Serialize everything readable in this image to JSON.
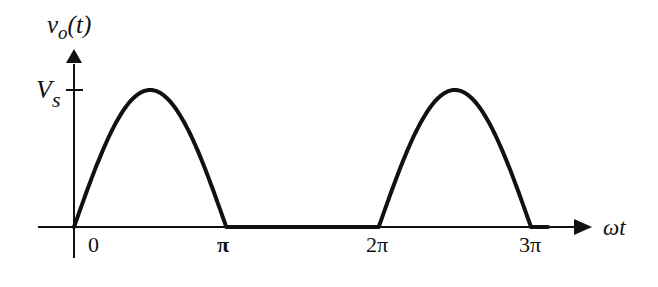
{
  "chart_data": {
    "type": "line",
    "title": "",
    "xlabel": "ωt",
    "ylabel": "v_o(t)",
    "ylabel_parts": {
      "main": "v",
      "sub": "o",
      "arg": "(t)"
    },
    "x_ticks": [
      {
        "value": 0,
        "label": "0"
      },
      {
        "value": 3.14159,
        "label": "π"
      },
      {
        "value": 6.28318,
        "label": "2π"
      },
      {
        "value": 9.42478,
        "label": "3π"
      }
    ],
    "y_ticks": [
      {
        "value": 1,
        "label": "V",
        "sub": "s"
      }
    ],
    "xlim": [
      0,
      9.42478
    ],
    "ylim": [
      0,
      1
    ],
    "grid": false,
    "legend": null,
    "series": [
      {
        "name": "v_o(t) half-wave rectified sine",
        "description": "Vs·sin(ωt) for 0≤ωt≤π and 2π≤ωt≤3π, zero otherwise",
        "x": [
          0,
          0.3927,
          0.7854,
          1.1781,
          1.5708,
          1.9635,
          2.3562,
          2.7489,
          3.14159,
          4.0,
          5.0,
          6.28318,
          6.6759,
          7.0686,
          7.4613,
          7.854,
          8.2467,
          8.6394,
          9.0321,
          9.42478
        ],
        "y": [
          0,
          0.383,
          0.707,
          0.924,
          1.0,
          0.924,
          0.707,
          0.383,
          0,
          0,
          0,
          0,
          0.383,
          0.707,
          0.924,
          1.0,
          0.924,
          0.707,
          0.383,
          0
        ]
      }
    ],
    "peak_label": "Vs"
  },
  "labels": {
    "y_axis_main": "v",
    "y_axis_sub": "o",
    "y_axis_arg": "(t)",
    "vs_main": "V",
    "vs_sub": "s",
    "x_axis": "ωt",
    "tick_0": "0",
    "tick_pi": "π",
    "tick_2pi": "2π",
    "tick_3pi": "3π"
  }
}
